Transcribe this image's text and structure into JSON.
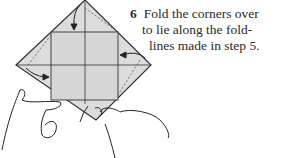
{
  "step": {
    "number": "6",
    "lines": [
      "Fold the corners over",
      "to lie along the fold-",
      "lines made in step 5."
    ]
  },
  "colors": {
    "paper": "#dcdcdc",
    "lines": "#333333"
  }
}
